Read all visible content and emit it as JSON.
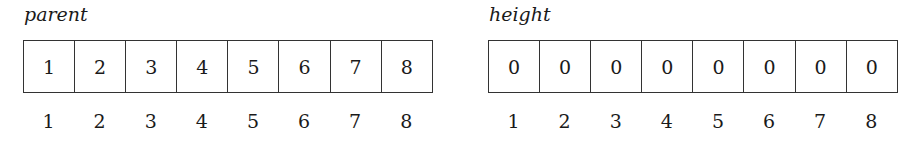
{
  "arrays": [
    {
      "label": "parent",
      "values": [
        "1",
        "2",
        "3",
        "4",
        "5",
        "6",
        "7",
        "8"
      ],
      "indices": [
        "1",
        "2",
        "3",
        "4",
        "5",
        "6",
        "7",
        "8"
      ]
    },
    {
      "label": "height",
      "values": [
        "0",
        "0",
        "0",
        "0",
        "0",
        "0",
        "0",
        "0"
      ],
      "indices": [
        "1",
        "2",
        "3",
        "4",
        "5",
        "6",
        "7",
        "8"
      ]
    }
  ]
}
